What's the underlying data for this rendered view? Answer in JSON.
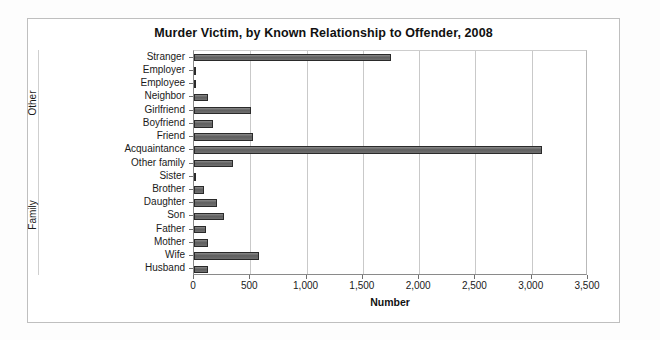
{
  "chart_data": {
    "type": "bar",
    "orientation": "horizontal",
    "title": "Murder Victim, by Known Relationship to Offender, 2008",
    "xlabel": "Number",
    "ylabel": "",
    "categories": [
      "Stranger",
      "Employer",
      "Employee",
      "Neighbor",
      "Girlfriend",
      "Boyfriend",
      "Friend",
      "Acquaintance",
      "Other family",
      "Sister",
      "Brother",
      "Daughter",
      "Son",
      "Father",
      "Mother",
      "Wife",
      "Husband"
    ],
    "values": [
      1750,
      20,
      15,
      120,
      510,
      165,
      520,
      3090,
      350,
      10,
      90,
      200,
      270,
      110,
      120,
      575,
      120
    ],
    "group_labels": [
      "Other",
      "Family"
    ],
    "groups": [
      {
        "label": "Other",
        "categories": [
          "Stranger",
          "Employer",
          "Employee",
          "Neighbor",
          "Girlfriend",
          "Boyfriend",
          "Friend",
          "Acquaintance"
        ]
      },
      {
        "label": "Family",
        "categories": [
          "Other family",
          "Sister",
          "Brother",
          "Daughter",
          "Son",
          "Father",
          "Mother",
          "Wife",
          "Husband"
        ]
      }
    ],
    "xlim": [
      0,
      3500
    ],
    "xticks": [
      0,
      500,
      1000,
      1500,
      2000,
      2500,
      3000,
      3500
    ],
    "xtick_labels": [
      "0",
      "500",
      "1,000",
      "1,500",
      "2,000",
      "2,500",
      "3,000",
      "3,500"
    ],
    "grid": true,
    "grid_axis": "x",
    "legend": false,
    "bar_color": "#6e6e6e",
    "bar_edge_color": "#2a2a2a"
  }
}
